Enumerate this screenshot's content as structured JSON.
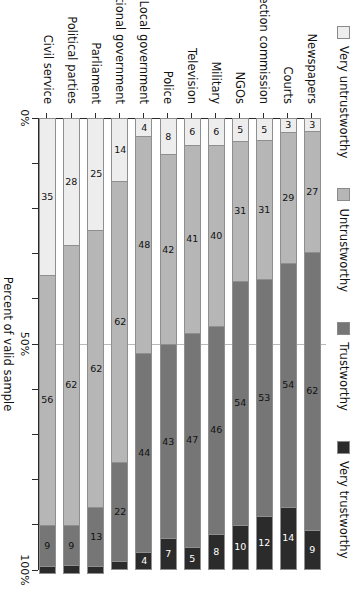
{
  "chart_data": {
    "type": "bar",
    "orientation": "horizontal-stacked",
    "title": "",
    "subtitle": "",
    "xlabel": "Percent of valid sample",
    "ylabel": "",
    "xlim": [
      0,
      100
    ],
    "grid": false,
    "reference_line": 50,
    "legend_position": "top",
    "stacked_percent": true,
    "categories": [
      "Newspapers",
      "Courts",
      "Election commission",
      "NGOs",
      "Military",
      "Television",
      "Police",
      "Local government",
      "National government",
      "Parliament",
      "Political parties",
      "Civil service"
    ],
    "series": [
      {
        "name": "Very untrustworthy",
        "color": "#ededed",
        "values": [
          3,
          3,
          5,
          5,
          6,
          6,
          8,
          4,
          14,
          25,
          28,
          35
        ]
      },
      {
        "name": "Untrustworthy",
        "color": "#b6b6b6",
        "values": [
          27,
          29,
          31,
          31,
          40,
          41,
          42,
          48,
          62,
          62,
          62,
          56
        ]
      },
      {
        "name": "Trustworthy",
        "color": "#767676",
        "values": [
          62,
          54,
          53,
          54,
          46,
          47,
          43,
          44,
          22,
          13,
          9,
          9
        ]
      },
      {
        "name": "Very trustworthy",
        "color": "#2b2b2b",
        "values": [
          9,
          14,
          12,
          10,
          8,
          5,
          7,
          4,
          2,
          1,
          1,
          1
        ]
      }
    ],
    "xticks": [
      0,
      10,
      20,
      30,
      40,
      50,
      60,
      70,
      80,
      90,
      100
    ],
    "xticklabels": [
      "0%",
      "",
      "",
      "",
      "",
      "50%",
      "",
      "",
      "",
      "",
      "100%"
    ]
  }
}
